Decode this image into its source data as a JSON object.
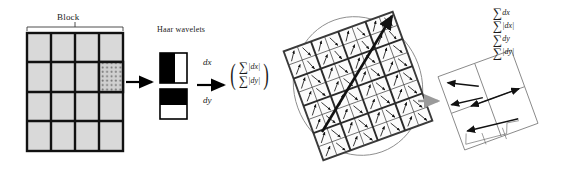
{
  "figure": {
    "background_color": "#ffffff"
  },
  "left_panel": {
    "block_label": "Block",
    "haar_label": "Haar wavelets",
    "dx_label": "dx",
    "dy_label": "dy",
    "grid": {
      "rows": 4,
      "cols": 4,
      "cell_fill": "#d9d9d9",
      "border_color": "#000000",
      "highlighted_cell": {
        "row": 2,
        "col": 4,
        "dots": 5
      }
    },
    "wavelets": [
      {
        "name": "dx-wavelet",
        "split": "vertical",
        "dark_side": "left"
      },
      {
        "name": "dy-wavelet",
        "split": "horizontal",
        "dark_side": "top"
      }
    ],
    "vector": {
      "open_paren": "(",
      "close_paren": ")",
      "rows": [
        {
          "sigma": "∑",
          "term": "|dx|"
        },
        {
          "sigma": "∑",
          "term": "|dy|"
        }
      ]
    }
  },
  "right_panel": {
    "descriptor_grid": {
      "blocks": 4,
      "subcells_per_block": 2,
      "rotation_deg": -20,
      "line_color": "#3a3a3a"
    },
    "orientation_arrow": {
      "name": "orientation-arrow",
      "color": "#111111"
    },
    "zoom_arrow": {
      "name": "gray-zoom-arrow",
      "color": "#9a9a9a"
    },
    "detail_cell": {
      "rows": 2,
      "cols": 2,
      "line_color": "#8a8a8a"
    },
    "detail_micro_labels": [
      "dx",
      "dy"
    ],
    "sums": [
      {
        "sigma": "∑",
        "term": "dx"
      },
      {
        "sigma": "∑",
        "term": "|dx|"
      },
      {
        "sigma": "∑",
        "term": "dy"
      },
      {
        "sigma": "∑",
        "term": "|dy|"
      }
    ]
  }
}
